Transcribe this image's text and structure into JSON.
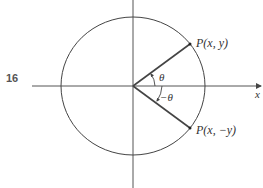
{
  "figure": {
    "number": "16",
    "labels": {
      "point_upper": "P(x, y)",
      "point_lower": "P(x, −y)",
      "angle_upper": "θ",
      "angle_lower": "−θ",
      "x_axis": "x"
    },
    "angle_deg": 30,
    "colors": {
      "stroke": "#444444",
      "text": "#333333"
    }
  }
}
